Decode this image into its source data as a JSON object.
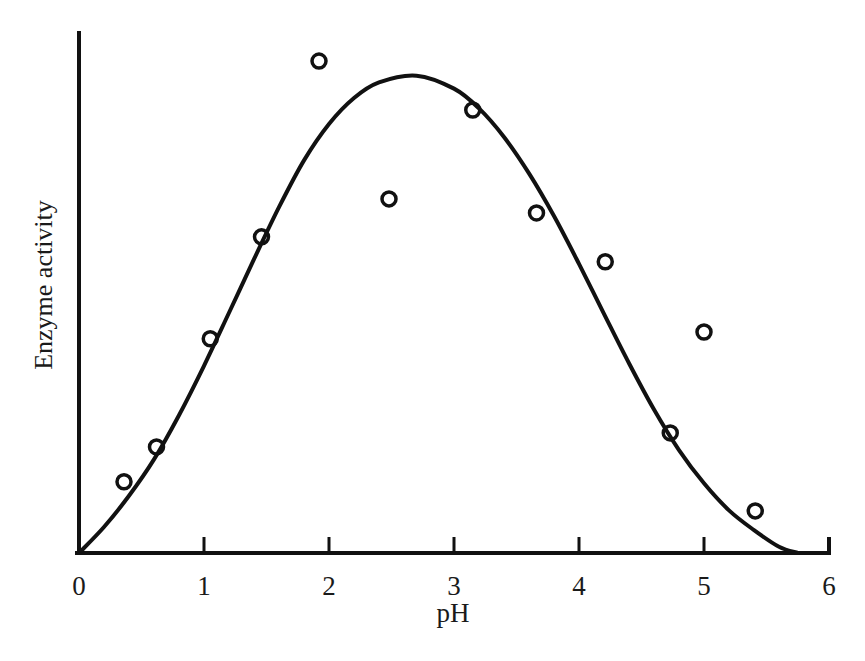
{
  "figure": {
    "background": "#ffffff",
    "ink_color": "#111111"
  },
  "axes": {
    "x_label": "pH",
    "y_label": "Enzyme activity",
    "x_ticks": [
      "0",
      "1",
      "2",
      "3",
      "4",
      "5",
      "6"
    ]
  },
  "chart_data": {
    "type": "scatter",
    "title": "",
    "subtitle": "",
    "xlabel": "pH",
    "ylabel": "Enzyme activity",
    "xlim": [
      0,
      6
    ],
    "ylim": [
      0,
      1
    ],
    "grid": false,
    "legend": "none",
    "x_tick_labels": [
      "0",
      "1",
      "2",
      "3",
      "4",
      "5",
      "6"
    ],
    "y_tick_labels": [],
    "y_axis_note": "Unlabeled / arbitrary units; axis shows no numeric ticks",
    "marker_style": "open circle",
    "marker_radius_px": 7,
    "series": [
      {
        "name": "Measured enzyme activity",
        "type": "scatter",
        "points": [
          {
            "x": 0.36,
            "y": 0.137
          },
          {
            "x": 0.62,
            "y": 0.204
          },
          {
            "x": 1.05,
            "y": 0.412
          },
          {
            "x": 1.46,
            "y": 0.608
          },
          {
            "x": 1.92,
            "y": 0.946
          },
          {
            "x": 2.48,
            "y": 0.681
          },
          {
            "x": 3.15,
            "y": 0.852
          },
          {
            "x": 3.66,
            "y": 0.654
          },
          {
            "x": 4.21,
            "y": 0.56
          },
          {
            "x": 4.73,
            "y": 0.231
          },
          {
            "x": 5.0,
            "y": 0.425
          },
          {
            "x": 5.41,
            "y": 0.081
          }
        ]
      },
      {
        "name": "Fitted bell curve",
        "type": "line",
        "description": "Smooth unimodal optimum curve rising from the origin, peaking near pH 2.7 and returning to the baseline near pH 5.7",
        "peak_x": 2.7,
        "peak_y": 0.918,
        "start_x": 0.0,
        "end_x": 5.75,
        "points": [
          {
            "x": 0.0,
            "y": 0.0
          },
          {
            "x": 0.2,
            "y": 0.05
          },
          {
            "x": 0.4,
            "y": 0.11
          },
          {
            "x": 0.6,
            "y": 0.18
          },
          {
            "x": 0.8,
            "y": 0.265
          },
          {
            "x": 1.0,
            "y": 0.36
          },
          {
            "x": 1.2,
            "y": 0.462
          },
          {
            "x": 1.4,
            "y": 0.565
          },
          {
            "x": 1.6,
            "y": 0.665
          },
          {
            "x": 1.8,
            "y": 0.755
          },
          {
            "x": 2.0,
            "y": 0.825
          },
          {
            "x": 2.2,
            "y": 0.875
          },
          {
            "x": 2.4,
            "y": 0.905
          },
          {
            "x": 2.7,
            "y": 0.918
          },
          {
            "x": 3.0,
            "y": 0.893
          },
          {
            "x": 3.2,
            "y": 0.855
          },
          {
            "x": 3.4,
            "y": 0.8
          },
          {
            "x": 3.6,
            "y": 0.73
          },
          {
            "x": 3.8,
            "y": 0.648
          },
          {
            "x": 4.0,
            "y": 0.556
          },
          {
            "x": 4.2,
            "y": 0.46
          },
          {
            "x": 4.4,
            "y": 0.365
          },
          {
            "x": 4.6,
            "y": 0.276
          },
          {
            "x": 4.8,
            "y": 0.198
          },
          {
            "x": 5.0,
            "y": 0.134
          },
          {
            "x": 5.2,
            "y": 0.082
          },
          {
            "x": 5.4,
            "y": 0.044
          },
          {
            "x": 5.6,
            "y": 0.012
          },
          {
            "x": 5.75,
            "y": 0.0
          }
        ]
      }
    ]
  },
  "geometry": {
    "origin_px": {
      "x": 79,
      "y": 553
    },
    "x_axis_end_px": 829,
    "y_axis_top_px": 33,
    "px_per_unit_x": 125,
    "tick_length_px": 16
  }
}
